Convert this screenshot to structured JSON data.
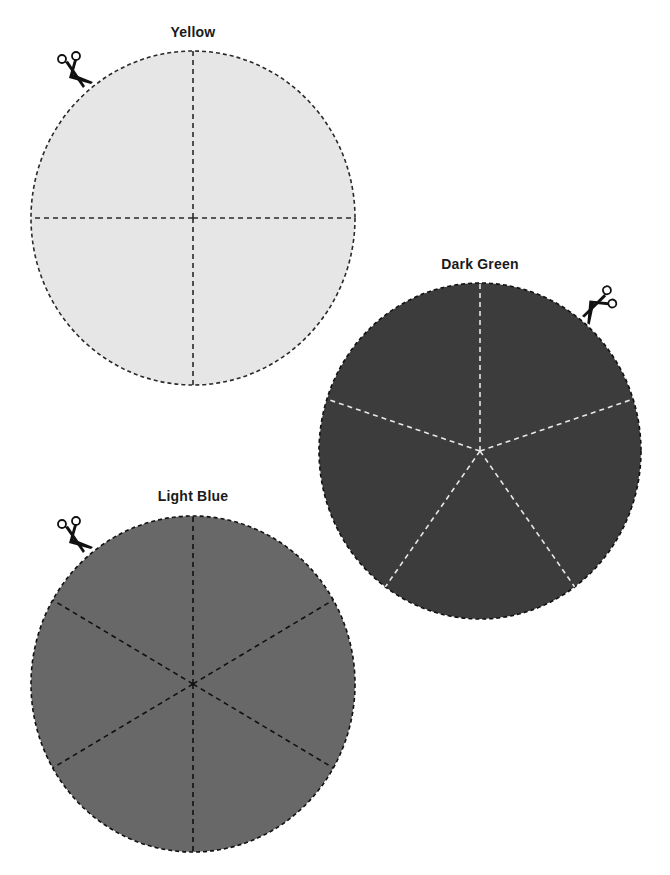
{
  "page": {
    "width": 670,
    "height": 875,
    "background": "#ffffff"
  },
  "circles": [
    {
      "id": "yellow",
      "label": "Yellow",
      "fill": "#e6e6e6",
      "outline_color": "#2a2a2a",
      "divider_color": "#2a2a2a",
      "slices": 4,
      "center": [
        193,
        218
      ],
      "rx": 162,
      "ry": 167,
      "start_angle_deg": -90,
      "label_pos": [
        193,
        38
      ],
      "scissors": {
        "pos": [
          73,
          70
        ],
        "rotate": 0,
        "icon": "scissors-icon"
      }
    },
    {
      "id": "dark-green",
      "label": "Dark Green",
      "fill": "#3c3c3c",
      "outline_color": "#111111",
      "divider_color": "#e8e8e8",
      "slices": 5,
      "center": [
        480,
        451
      ],
      "rx": 161,
      "ry": 168,
      "start_angle_deg": -90,
      "label_pos": [
        480,
        270
      ],
      "scissors": {
        "pos": [
          598,
          303
        ],
        "rotate": 80,
        "icon": "scissors-icon"
      }
    },
    {
      "id": "light-blue",
      "label": "Light Blue",
      "fill": "#686868",
      "outline_color": "#111111",
      "divider_color": "#111111",
      "slices": 6,
      "center": [
        193,
        684
      ],
      "rx": 162,
      "ry": 168,
      "start_angle_deg": -90,
      "label_pos": [
        193,
        502
      ],
      "scissors": {
        "pos": [
          73,
          535
        ],
        "rotate": 0,
        "icon": "scissors-icon"
      }
    }
  ]
}
